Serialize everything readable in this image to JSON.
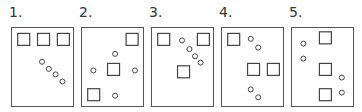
{
  "panels": [
    {
      "label": "1.",
      "squares": [
        [
          0.1,
          0.1
        ],
        [
          0.42,
          0.1
        ],
        [
          0.74,
          0.1
        ]
      ],
      "circles": [
        [
          0.5,
          0.44
        ],
        [
          0.61,
          0.53
        ],
        [
          0.72,
          0.6
        ],
        [
          0.83,
          0.69
        ]
      ]
    },
    {
      "label": "2.",
      "squares": [
        [
          0.72,
          0.1
        ],
        [
          0.42,
          0.48
        ],
        [
          0.1,
          0.8
        ]
      ],
      "circles": [
        [
          0.55,
          0.34
        ],
        [
          0.2,
          0.55
        ],
        [
          0.87,
          0.55
        ],
        [
          0.55,
          0.87
        ]
      ]
    },
    {
      "label": "3.",
      "squares": [
        [
          0.1,
          0.1
        ],
        [
          0.74,
          0.1
        ],
        [
          0.42,
          0.51
        ]
      ],
      "circles": [
        [
          0.5,
          0.17
        ],
        [
          0.62,
          0.28
        ],
        [
          0.71,
          0.37
        ],
        [
          0.8,
          0.45
        ]
      ]
    },
    {
      "label": "4.",
      "squares": [
        [
          0.1,
          0.1
        ],
        [
          0.42,
          0.48
        ],
        [
          0.74,
          0.48
        ]
      ],
      "circles": [
        [
          0.48,
          0.15
        ],
        [
          0.6,
          0.26
        ],
        [
          0.48,
          0.79
        ],
        [
          0.6,
          0.89
        ]
      ]
    },
    {
      "label": "5.",
      "squares": [
        [
          0.45,
          0.08
        ],
        [
          0.45,
          0.48
        ],
        [
          0.45,
          0.8
        ]
      ],
      "circles": [
        [
          0.2,
          0.21
        ],
        [
          0.2,
          0.4
        ],
        [
          0.82,
          0.64
        ],
        [
          0.82,
          0.83
        ]
      ]
    }
  ]
}
